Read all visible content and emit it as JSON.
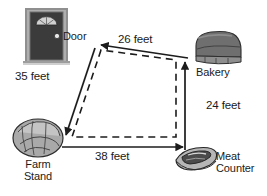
{
  "diagram": {
    "type": "labeled-path-diagram",
    "locations": [
      {
        "id": "door",
        "name": "Door",
        "icon": "door-icon"
      },
      {
        "id": "bakery",
        "name": "Bakery",
        "icon": "bread-loaf-icon"
      },
      {
        "id": "meat",
        "name_line1": "Meat",
        "name_line2": "Counter",
        "icon": "steak-icon"
      },
      {
        "id": "farm",
        "name_line1": "Farm",
        "name_line2": "Stand",
        "icon": "cabbage-icon"
      }
    ],
    "labels": {
      "door": "Door",
      "bakery": "Bakery",
      "meat_line1": "Meat",
      "meat_line2": "Counter",
      "farm_line1": "Farm",
      "farm_line2": "Stand"
    },
    "segments": [
      {
        "id": "door-farm",
        "from": "Door",
        "to": "Farm Stand",
        "distance": "35 feet",
        "value": 35,
        "unit": "feet",
        "style": "solid-arrow"
      },
      {
        "id": "farm-meat",
        "from": "Farm Stand",
        "to": "Meat Counter",
        "distance": "38 feet",
        "value": 38,
        "unit": "feet",
        "style": "solid-arrow"
      },
      {
        "id": "meat-bakery",
        "from": "Meat Counter",
        "to": "Bakery",
        "distance": "24 feet",
        "value": 24,
        "unit": "feet",
        "style": "solid-arrow"
      },
      {
        "id": "bakery-door",
        "from": "Bakery",
        "to": "Door",
        "distance": "26 feet",
        "value": 26,
        "unit": "feet",
        "style": "solid-arrow"
      }
    ],
    "distances": {
      "door_farm": "35 feet",
      "farm_meat": "38 feet",
      "meat_bakery": "24 feet",
      "bakery_door": "26 feet"
    },
    "colors": {
      "line": "#1c1c1c",
      "background": "#ffffff",
      "icon_dark": "#3a3a3a",
      "icon_mid": "#8c8c8c",
      "icon_light": "#c9c9c9"
    }
  }
}
